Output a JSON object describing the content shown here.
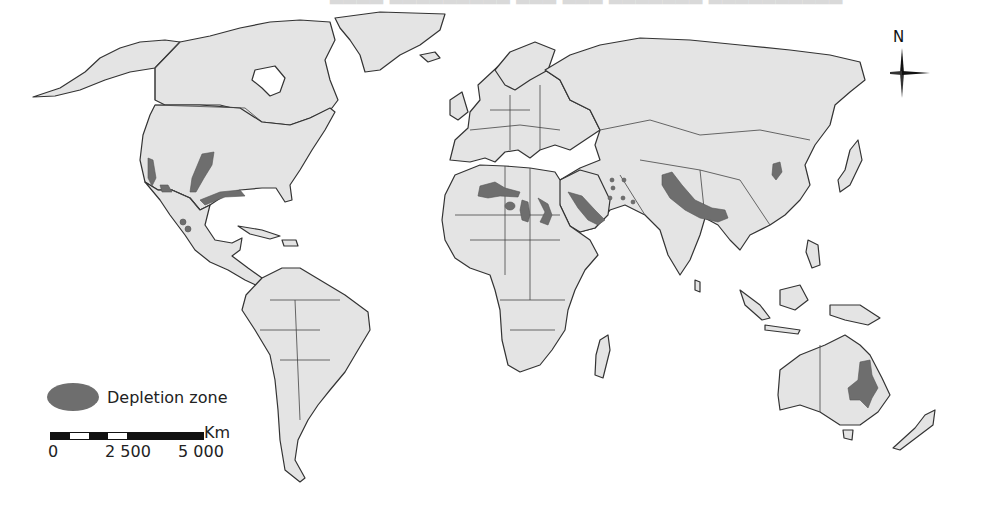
{
  "figure": {
    "type": "world_map",
    "colors": {
      "background": "#ffffff",
      "land": "#e4e4e4",
      "border": "#333333",
      "depletion_zone": "#6e6e6e"
    },
    "cropped_heading_text": ""
  },
  "legend": {
    "items": [
      {
        "label": "Depletion zone",
        "color": "#6e6e6e",
        "shape": "ellipse"
      }
    ]
  },
  "scale_bar": {
    "unit": "Km",
    "ticks": [
      "0",
      "2 500",
      "5 000"
    ]
  },
  "north_arrow": {
    "label": "N"
  },
  "depletion_zones": [
    {
      "region": "California Central Valley"
    },
    {
      "region": "US High Plains (Ogallala)"
    },
    {
      "region": "US Gulf Coast"
    },
    {
      "region": "Arizona / Northwest Mexico"
    },
    {
      "region": "Central Mexico"
    },
    {
      "region": "North Africa (Algeria/Tunisia)"
    },
    {
      "region": "Libya"
    },
    {
      "region": "Egypt / Nile"
    },
    {
      "region": "Arabian Peninsula"
    },
    {
      "region": "Iran (scattered)"
    },
    {
      "region": "Northwest India / Pakistan / Ganges"
    },
    {
      "region": "North China Plain"
    },
    {
      "region": "Murray-Darling Basin, Australia"
    }
  ]
}
